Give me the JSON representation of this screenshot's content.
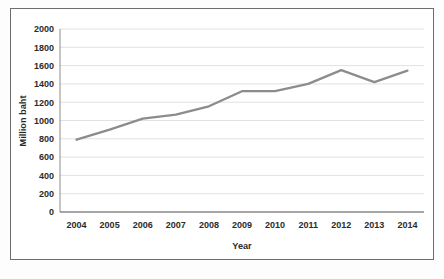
{
  "chart_data": {
    "type": "line",
    "title": "",
    "xlabel": "Year",
    "ylabel": "Million baht",
    "categories": [
      "2004",
      "2005",
      "2006",
      "2007",
      "2008",
      "2009",
      "2010",
      "2011",
      "2012",
      "2013",
      "2014"
    ],
    "values": [
      790,
      900,
      1020,
      1065,
      1155,
      1320,
      1320,
      1400,
      1550,
      1420,
      1545
    ],
    "series": [
      {
        "name": "Million baht",
        "values": [
          790,
          900,
          1020,
          1065,
          1155,
          1320,
          1320,
          1400,
          1550,
          1420,
          1545
        ]
      }
    ],
    "ylim": [
      0,
      2000
    ],
    "ytick_labels": [
      "0",
      "200",
      "400",
      "600",
      "800",
      "1000",
      "1200",
      "1400",
      "1600",
      "1800",
      "2000"
    ],
    "ytick_values": [
      0,
      200,
      400,
      600,
      800,
      1000,
      1200,
      1400,
      1600,
      1800,
      2000
    ],
    "xtick_labels": [
      "2004",
      "2005",
      "2006",
      "2007",
      "2008",
      "2009",
      "2010",
      "2011",
      "2012",
      "2013",
      "2014"
    ],
    "grid": true,
    "grid_axis": "y",
    "legend": false,
    "legend_position": "none",
    "line_color": "#8c8c8c",
    "grid_color": "#d9d9d9",
    "axis_color": "#808080",
    "text_color": "#2b2b2b",
    "border_color": "#6d6d6d",
    "background_color": "#ffffff"
  },
  "caption": {
    "text": ""
  }
}
